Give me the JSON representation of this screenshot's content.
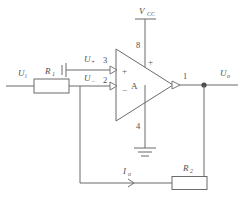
{
  "diagram": {
    "type": "schematic",
    "background_color": "#ffffff",
    "line_color": "#6b6b6b",
    "text_color": "#4f4f4f"
  },
  "labels": {
    "supply": {
      "base": "V",
      "sub": "CC"
    },
    "input_voltage": {
      "base": "U",
      "sub": "i"
    },
    "resistor_input": {
      "base": "R",
      "sub": "1"
    },
    "resistor_feedback": {
      "base": "R",
      "sub": "2"
    },
    "noninverting_input": {
      "base": "U",
      "sub": "+"
    },
    "inverting_input": {
      "base": "U",
      "sub": "−"
    },
    "output_voltage": {
      "base": "U",
      "sub": "o"
    },
    "output_current": {
      "base": "I",
      "sub": "o"
    },
    "amplifier": "A"
  },
  "pins": {
    "noninverting": "3",
    "inverting": "2",
    "supply": "8",
    "ground": "4",
    "output": "1"
  },
  "terminal_signs": {
    "noninverting": "+",
    "inverting": "−",
    "supply_rail": "+"
  },
  "nodes": [
    {
      "name": "output-node",
      "x": 204,
      "y": 85
    }
  ],
  "components": [
    {
      "name": "resistor-R1",
      "x": 34,
      "y": 79,
      "width": 35,
      "height": 14
    },
    {
      "name": "resistor-R2",
      "x": 172,
      "y": 177,
      "width": 35,
      "height": 13
    },
    {
      "name": "opamp-triangle",
      "x": 116,
      "y": 49,
      "width": 57,
      "height": 72
    },
    {
      "name": "ground-symbol",
      "x": 145,
      "y": 148
    },
    {
      "name": "supply-terminal-bar",
      "x": 145,
      "y": 19
    },
    {
      "name": "input-terminal-marker",
      "x": 62,
      "y": 70
    }
  ]
}
